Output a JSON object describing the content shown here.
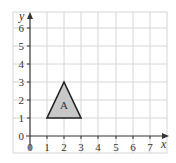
{
  "diagram": {
    "type": "coordinate-grid",
    "x_axis": {
      "label": "x",
      "min": 0,
      "max": 7,
      "ticks": [
        "0",
        "1",
        "2",
        "3",
        "4",
        "5",
        "6",
        "7"
      ]
    },
    "y_axis": {
      "label": "y",
      "min": 0,
      "max": 6,
      "ticks": [
        "0",
        "1",
        "2",
        "3",
        "4",
        "5",
        "6"
      ]
    },
    "shapes": [
      {
        "name": "A",
        "type": "triangle",
        "vertices": [
          [
            1,
            1
          ],
          [
            3,
            1
          ],
          [
            2,
            3
          ]
        ],
        "fill": "#c8c8c8",
        "stroke": "#222222"
      }
    ],
    "colors": {
      "grid": "#d6d6d6",
      "axis": "#333333",
      "background": "#ffffff"
    }
  }
}
